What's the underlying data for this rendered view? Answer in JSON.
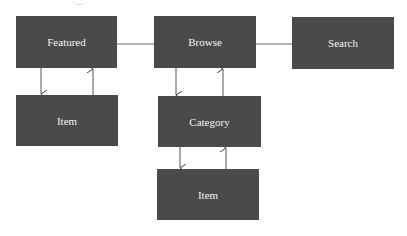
{
  "diagram": {
    "colors": {
      "node_fill": "#4a4a4a",
      "node_text": "#f2f2f2",
      "edge": "#555555",
      "background": "#ffffff"
    },
    "nodes": [
      {
        "id": "featured",
        "label": "Featured",
        "x": 16,
        "y": 16,
        "w": 101,
        "h": 52
      },
      {
        "id": "browse",
        "label": "Browse",
        "x": 154,
        "y": 16,
        "w": 102,
        "h": 52
      },
      {
        "id": "search",
        "label": "Search",
        "x": 292,
        "y": 17,
        "w": 102,
        "h": 52
      },
      {
        "id": "item-featured",
        "label": "Item",
        "x": 16,
        "y": 95,
        "w": 102,
        "h": 51
      },
      {
        "id": "category",
        "label": "Category",
        "x": 158,
        "y": 96,
        "w": 103,
        "h": 51
      },
      {
        "id": "item-category",
        "label": "Item",
        "x": 157,
        "y": 169,
        "w": 102,
        "h": 51
      }
    ],
    "edges": [
      {
        "from": "featured",
        "to": "browse",
        "type": "line"
      },
      {
        "from": "browse",
        "to": "search",
        "type": "line"
      },
      {
        "from": "featured",
        "to": "item-featured",
        "type": "arrow-down"
      },
      {
        "from": "item-featured",
        "to": "featured",
        "type": "arrow-up"
      },
      {
        "from": "browse",
        "to": "category",
        "type": "arrow-down"
      },
      {
        "from": "category",
        "to": "browse",
        "type": "arrow-up"
      },
      {
        "from": "category",
        "to": "item-category",
        "type": "arrow-down"
      },
      {
        "from": "item-category",
        "to": "category",
        "type": "arrow-up"
      }
    ]
  }
}
